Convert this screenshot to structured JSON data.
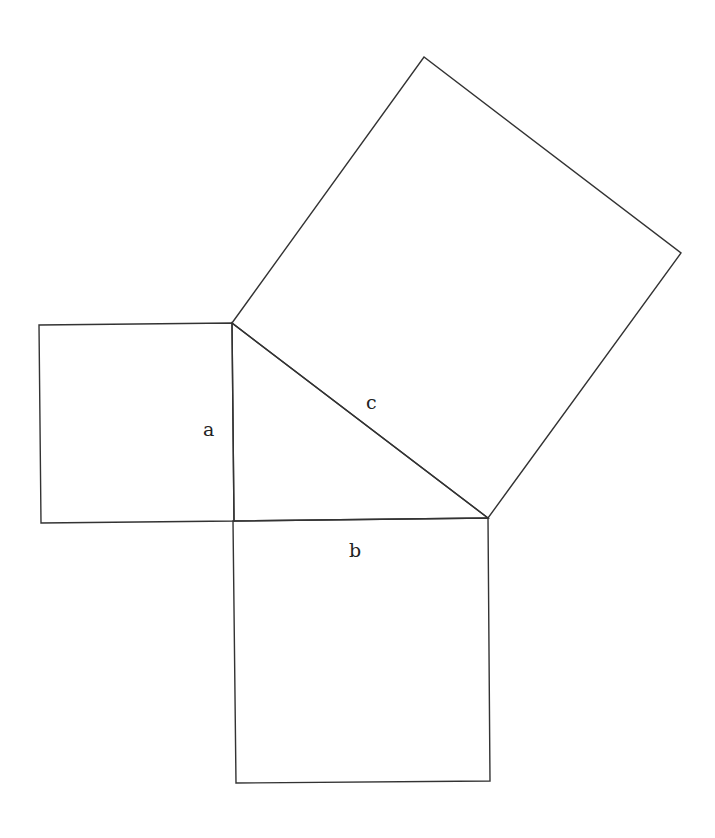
{
  "diagram": {
    "stroke_color": "#333333",
    "background": "#ffffff",
    "shapes": {
      "square_a": {
        "points": "39,325 232,323 234,521 41,523"
      },
      "square_b": {
        "points": "233,521 488,518 490,781 236,783"
      },
      "square_c": {
        "points": "232,323 424,57 681,253 488,518"
      },
      "triangle": {
        "points": "232,323 234,521 488,518"
      }
    },
    "labels": {
      "a": {
        "text": "a",
        "x": 203,
        "y": 436
      },
      "b": {
        "text": "b",
        "x": 349,
        "y": 557
      },
      "c": {
        "text": "c",
        "x": 366,
        "y": 409
      }
    }
  }
}
